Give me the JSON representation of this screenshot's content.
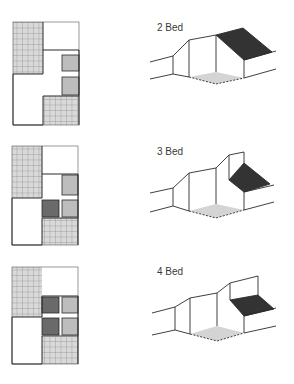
{
  "figure": {
    "type": "housing-unit-type-comparison",
    "rows": [
      {
        "label": "2 Bed",
        "plan": {
          "light_gray_rooms": 2,
          "dark_gray_rooms": 0
        },
        "axonometric": {
          "roof": "pitched-dark",
          "floor_patch": "dashed-gray"
        }
      },
      {
        "label": "3 Bed",
        "plan": {
          "light_gray_rooms": 2,
          "dark_gray_rooms": 1
        },
        "axonometric": {
          "roof": "stepped-dark",
          "floor_patch": "dashed-gray"
        }
      },
      {
        "label": "4 Bed",
        "plan": {
          "light_gray_rooms": 2,
          "dark_gray_rooms": 2
        },
        "axonometric": {
          "roof": "flat-dark-terrace",
          "floor_patch": "dashed-gray"
        }
      }
    ]
  },
  "colors": {
    "grid_fill": "#d9d9d9",
    "grid_line": "#8a8a8a",
    "outline": "#2a2a2a",
    "light_room": "#bdbdbd",
    "dark_room": "#6a6a6a",
    "roof_dark": "#2b2b2b",
    "floor_patch": "#d4d4d4"
  }
}
